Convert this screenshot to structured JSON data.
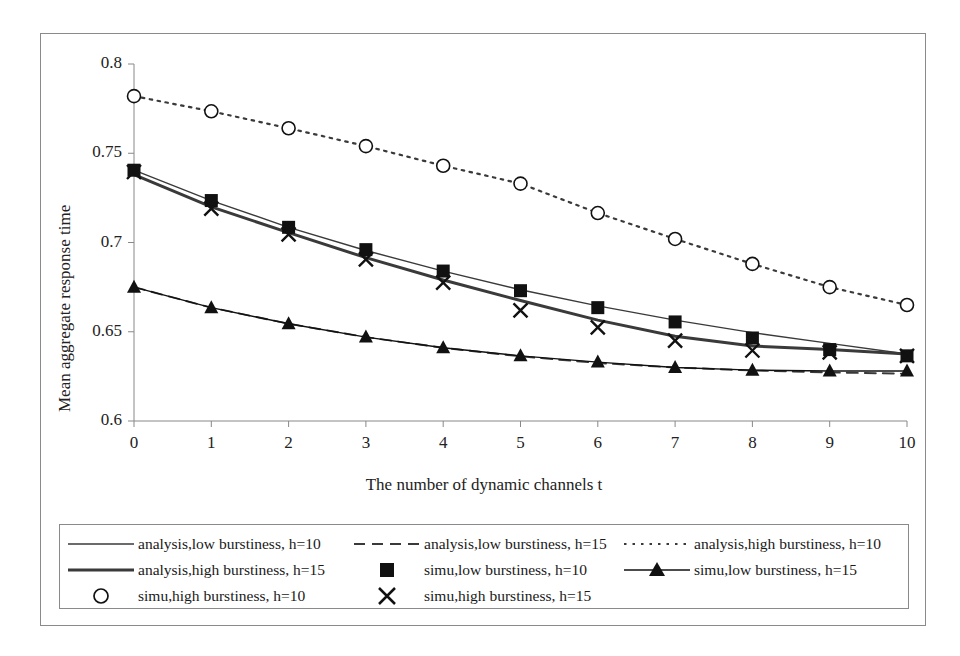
{
  "chart_data": {
    "type": "line",
    "title": "",
    "xlabel": "The number of dynamic channels t",
    "ylabel": "Mean aggregate response time",
    "x": [
      0,
      1,
      2,
      3,
      4,
      5,
      6,
      7,
      8,
      9,
      10
    ],
    "xticks": [
      "0",
      "1",
      "2",
      "3",
      "4",
      "5",
      "6",
      "7",
      "8",
      "9",
      "10"
    ],
    "yticks": [
      "0.6",
      "0.65",
      "0.7",
      "0.75",
      "0.8"
    ],
    "xlim": [
      0,
      10
    ],
    "ylim": [
      0.6,
      0.8
    ],
    "grid": false,
    "legend_position": "below-plot",
    "series": [
      {
        "name": "analysis,low burstiness, h=10",
        "style": "solid-thin",
        "marker": "none",
        "color": "#3a3a3a",
        "values": [
          0.7405,
          0.7235,
          0.7085,
          0.6955,
          0.684,
          0.6735,
          0.6645,
          0.6565,
          0.6495,
          0.6435,
          0.6375
        ]
      },
      {
        "name": "analysis,low burstiness, h=15",
        "style": "dashed",
        "marker": "none",
        "color": "#3a3a3a",
        "values": [
          0.675,
          0.6635,
          0.6545,
          0.647,
          0.641,
          0.6362,
          0.6325,
          0.63,
          0.6283,
          0.6272,
          0.6265
        ]
      },
      {
        "name": "analysis,high burstiness, h=10",
        "style": "dotted",
        "marker": "none",
        "color": "#3a3a3a",
        "values": [
          0.782,
          0.7735,
          0.764,
          0.754,
          0.743,
          0.733,
          0.7165,
          0.702,
          0.688,
          0.675,
          0.665
        ]
      },
      {
        "name": "analysis,high burstiness, h=15",
        "style": "solid-thick",
        "marker": "none",
        "color": "#3a3a3a",
        "values": [
          0.738,
          0.72,
          0.7055,
          0.6915,
          0.679,
          0.6675,
          0.6565,
          0.6475,
          0.642,
          0.64,
          0.6375
        ]
      },
      {
        "name": "simu,low burstiness, h=10",
        "style": "none",
        "marker": "square",
        "color": "#111111",
        "values": [
          0.7405,
          0.7235,
          0.7085,
          0.696,
          0.684,
          0.673,
          0.6635,
          0.6555,
          0.6465,
          0.64,
          0.6365
        ]
      },
      {
        "name": "simu,low burstiness, h=15",
        "style": "solid-thin",
        "marker": "triangle",
        "color": "#111111",
        "values": [
          0.675,
          0.6635,
          0.6545,
          0.647,
          0.641,
          0.6365,
          0.633,
          0.63,
          0.6285,
          0.628,
          0.628
        ]
      },
      {
        "name": "simu,high burstiness, h=10",
        "style": "none",
        "marker": "circle",
        "color": "#111111",
        "values": [
          0.782,
          0.7735,
          0.764,
          0.754,
          0.743,
          0.733,
          0.7165,
          0.702,
          0.688,
          0.675,
          0.665
        ]
      },
      {
        "name": "simu,high burstiness, h=15",
        "style": "none",
        "marker": "cross",
        "color": "#111111",
        "values": [
          0.7395,
          0.719,
          0.7045,
          0.6905,
          0.6775,
          0.662,
          0.6525,
          0.645,
          0.6395,
          0.6385,
          0.6365
        ]
      }
    ]
  },
  "legend": {
    "rows": [
      [
        {
          "label": "analysis,low burstiness, h=10",
          "sym": "solid-thin"
        },
        {
          "label": "analysis,low burstiness, h=15",
          "sym": "dashed"
        },
        {
          "label": "analysis,high burstiness, h=10",
          "sym": "dotted"
        }
      ],
      [
        {
          "label": "analysis,high burstiness, h=15",
          "sym": "solid-thick"
        },
        {
          "label": "simu,low burstiness, h=10",
          "sym": "square"
        },
        {
          "label": "simu,low burstiness, h=15",
          "sym": "line-triangle"
        }
      ],
      [
        {
          "label": "simu,high burstiness, h=10",
          "sym": "circle"
        },
        {
          "label": "simu,high burstiness, h=15",
          "sym": "cross"
        }
      ]
    ]
  }
}
